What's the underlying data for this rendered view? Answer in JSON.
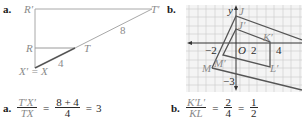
{
  "part_a": {
    "label": "a.",
    "points": {
      "R_prime": "R′",
      "T_prime": "T′",
      "R": "R",
      "T": "T",
      "X": "X′ = X"
    },
    "segments": {
      "TT_prime_length": "8",
      "XT_length": "4"
    },
    "formula": {
      "label": "a.",
      "numerator": "T′X′",
      "denominator": "TX",
      "equals1": "=",
      "value_numerator": "8 + 4",
      "value_denominator": "4",
      "equals2": "=",
      "result": "3"
    }
  },
  "part_b": {
    "label": "b.",
    "axes": {
      "y_label": "y",
      "origin_label": "O",
      "x_ticks": [
        "−2",
        "2",
        "4"
      ],
      "y_ticks": [
        "−3"
      ]
    },
    "points": {
      "J": "J",
      "J_prime": "J′",
      "K_prime": "K′",
      "L_prime": "L′",
      "M": "M",
      "M_prime": "M′"
    },
    "formula": {
      "label": "b.",
      "numerator": "K′L′",
      "denominator": "KL",
      "equals1": "=",
      "value_numerator": "2",
      "value_denominator": "4",
      "equals2": "=",
      "result_numerator": "1",
      "result_denominator": "2"
    }
  },
  "colors": {
    "line_light": "#9a9a9a",
    "line_dark": "#555555",
    "grid": "#c8c8c8",
    "grid_bg": "#f3f3f3",
    "label_gray": "#8a8a8a",
    "text_dark": "#1a1a1a"
  }
}
